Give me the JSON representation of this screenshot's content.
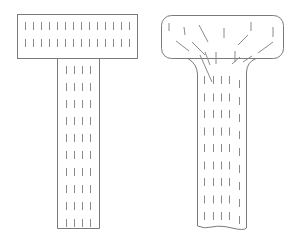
{
  "diagram": {
    "stroke_color": "#7a7a7a",
    "hatch_color": "#8a8a8a",
    "background": "#ffffff",
    "figures": [
      {
        "name": "left-t-shape",
        "style": "rigid",
        "top_bar": {
          "x": 17,
          "y": 14,
          "w": 120,
          "h": 44
        },
        "stem": {
          "x": 57,
          "y": 58,
          "w": 42,
          "h": 170
        }
      },
      {
        "name": "right-t-shape",
        "style": "rounded-flared",
        "top_bar": {
          "x": 161,
          "y": 15,
          "w": 122,
          "h": 43,
          "rx": 10
        },
        "stem": {
          "x": 197,
          "y": 58,
          "w": 50,
          "h": 170
        }
      }
    ]
  }
}
